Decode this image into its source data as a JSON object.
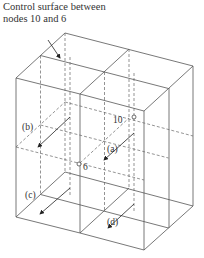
{
  "title": {
    "line1": "Control surface between",
    "line2": "nodes 10 and 6"
  },
  "labels": {
    "a": "(a)",
    "b": "(b)",
    "c": "(c)",
    "d": "(d)",
    "node10": "10",
    "node6": "6"
  },
  "colors": {
    "line": "#555555",
    "dash": "#666666"
  }
}
